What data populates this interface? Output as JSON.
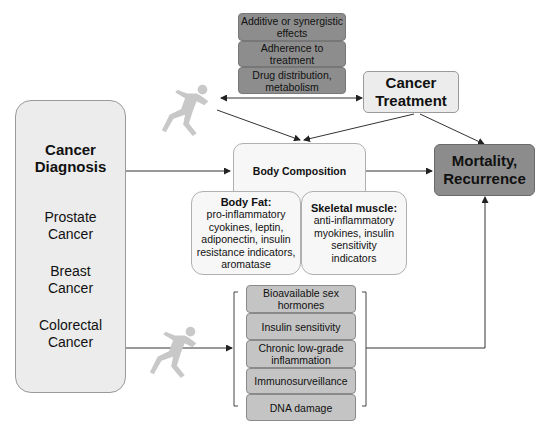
{
  "top_factors": [
    "Additive or synergistic effects",
    "Adherence to treatment",
    "Drug distribution, metabolism"
  ],
  "cancer_treatment": {
    "line1": "Cancer",
    "line2": "Treatment"
  },
  "cancer_diagnosis": {
    "title_line1": "Cancer",
    "title_line2": "Diagnosis",
    "types": [
      {
        "line1": "Prostate",
        "line2": "Cancer"
      },
      {
        "line1": "Breast",
        "line2": "Cancer"
      },
      {
        "line1": "Colorectal",
        "line2": "Cancer"
      }
    ]
  },
  "body_composition": {
    "title": "Body Composition",
    "body_fat": {
      "title": "Body Fat:",
      "lines": [
        "pro-inflammatory",
        "cyokines, leptin,",
        "adiponectin, insulin",
        "resistance indicators,",
        "aromatase"
      ]
    },
    "skeletal_muscle": {
      "title": "Skeletal muscle:",
      "lines": [
        "anti-inflammatory",
        "myokines, insulin",
        "sensitivity",
        "indicators"
      ]
    }
  },
  "outcome": {
    "line1": "Mortality,",
    "line2": "Recurrence"
  },
  "mechanisms": [
    "Bioavailable sex hormones",
    "Insulin sensitivity",
    "Chronic low-grade inflammation",
    "Immunosurveillance",
    "DNA damage"
  ],
  "colors": {
    "dark_box": "#8c8c8c",
    "light_box": "#ececec",
    "mechanism_box": "#c4c4c4",
    "runner": "#c8c8c8",
    "line": "#333333"
  }
}
